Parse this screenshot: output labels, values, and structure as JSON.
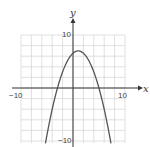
{
  "chart_data": {
    "type": "line",
    "title": "",
    "xlabel": "x",
    "ylabel": "y",
    "xlim": [
      -10,
      10
    ],
    "ylim": [
      -10,
      10
    ],
    "grid": true,
    "grid_step": 2,
    "tick_labels": {
      "x_min": "−10",
      "x_max": "10",
      "y_max": "10",
      "y_min": "−10"
    },
    "series": [
      {
        "name": "parabola",
        "equation": "y = -0.44(x - 1)^2 + 7",
        "vertex": [
          1,
          7
        ],
        "x_intercepts": [
          -3,
          5
        ],
        "x": [
          -5.2,
          -4,
          -3,
          -2,
          -1,
          0,
          1,
          2,
          3,
          4,
          5,
          6,
          7.2
        ],
        "y": [
          -10,
          -4.84,
          0,
          3.04,
          5.24,
          6.56,
          7,
          6.56,
          5.24,
          3.04,
          0,
          -4,
          -10
        ]
      }
    ]
  },
  "colors": {
    "curve": "#555555",
    "axis": "#333333",
    "grid": "#d8d8d8"
  }
}
